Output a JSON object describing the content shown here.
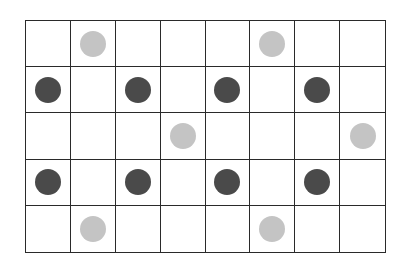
{
  "grid": {
    "rows": 5,
    "cols": 8,
    "line_color": "#2a2a2a",
    "background": "#ffffff"
  },
  "colors": {
    "dark": "#4a4a4a",
    "light": "#c4c4c4"
  },
  "dots": [
    {
      "row": 0,
      "col": 1,
      "shade": "light"
    },
    {
      "row": 0,
      "col": 5,
      "shade": "light"
    },
    {
      "row": 1,
      "col": 0,
      "shade": "dark"
    },
    {
      "row": 1,
      "col": 2,
      "shade": "dark"
    },
    {
      "row": 1,
      "col": 4,
      "shade": "dark"
    },
    {
      "row": 1,
      "col": 6,
      "shade": "dark"
    },
    {
      "row": 2,
      "col": 3,
      "shade": "light"
    },
    {
      "row": 2,
      "col": 7,
      "shade": "light"
    },
    {
      "row": 3,
      "col": 0,
      "shade": "dark"
    },
    {
      "row": 3,
      "col": 2,
      "shade": "dark"
    },
    {
      "row": 3,
      "col": 4,
      "shade": "dark"
    },
    {
      "row": 3,
      "col": 6,
      "shade": "dark"
    },
    {
      "row": 4,
      "col": 1,
      "shade": "light"
    },
    {
      "row": 4,
      "col": 5,
      "shade": "light"
    }
  ]
}
